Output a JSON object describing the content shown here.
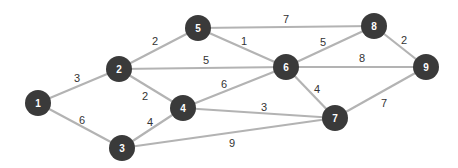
{
  "graph": {
    "node_color": "#3a3a3a",
    "edge_color": "#b3b3b3",
    "nodes": [
      {
        "id": "1",
        "x": 38,
        "y": 103
      },
      {
        "id": "2",
        "x": 119,
        "y": 69
      },
      {
        "id": "3",
        "x": 122,
        "y": 148
      },
      {
        "id": "4",
        "x": 183,
        "y": 108
      },
      {
        "id": "5",
        "x": 198,
        "y": 28
      },
      {
        "id": "6",
        "x": 286,
        "y": 67
      },
      {
        "id": "7",
        "x": 335,
        "y": 118
      },
      {
        "id": "8",
        "x": 374,
        "y": 26
      },
      {
        "id": "9",
        "x": 426,
        "y": 67
      }
    ],
    "edges": [
      {
        "from": "1",
        "to": "2",
        "weight": "3",
        "lx": 77,
        "ly": 78
      },
      {
        "from": "1",
        "to": "3",
        "weight": "6",
        "lx": 82,
        "ly": 120
      },
      {
        "from": "2",
        "to": "5",
        "weight": "2",
        "lx": 155,
        "ly": 41
      },
      {
        "from": "2",
        "to": "6",
        "weight": "5",
        "lx": 206,
        "ly": 60
      },
      {
        "from": "2",
        "to": "4",
        "weight": "2",
        "lx": 145,
        "ly": 96
      },
      {
        "from": "3",
        "to": "4",
        "weight": "4",
        "lx": 150,
        "ly": 122
      },
      {
        "from": "3",
        "to": "7",
        "weight": "9",
        "lx": 232,
        "ly": 143
      },
      {
        "from": "4",
        "to": "6",
        "weight": "6",
        "lx": 224,
        "ly": 84
      },
      {
        "from": "4",
        "to": "7",
        "weight": "3",
        "lx": 264,
        "ly": 107
      },
      {
        "from": "5",
        "to": "8",
        "weight": "7",
        "lx": 286,
        "ly": 19
      },
      {
        "from": "5",
        "to": "6",
        "weight": "1",
        "lx": 244,
        "ly": 41
      },
      {
        "from": "6",
        "to": "8",
        "weight": "5",
        "lx": 323,
        "ly": 42
      },
      {
        "from": "6",
        "to": "9",
        "weight": "8",
        "lx": 362,
        "ly": 58
      },
      {
        "from": "6",
        "to": "7",
        "weight": "4",
        "lx": 317,
        "ly": 89
      },
      {
        "from": "8",
        "to": "9",
        "weight": "2",
        "lx": 404,
        "ly": 40
      },
      {
        "from": "7",
        "to": "9",
        "weight": "7",
        "lx": 384,
        "ly": 103
      }
    ]
  }
}
